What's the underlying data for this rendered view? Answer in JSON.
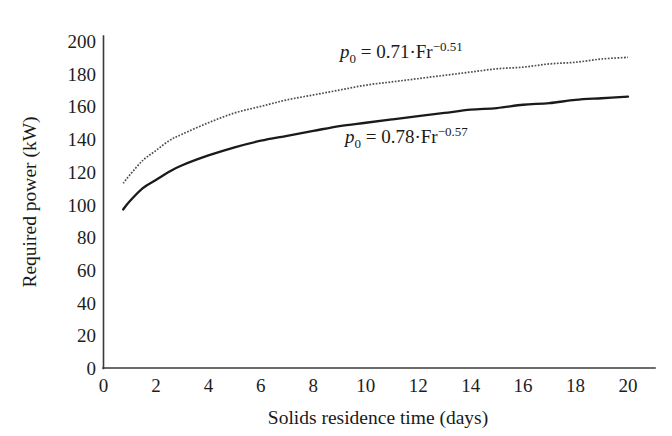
{
  "chart_data": {
    "type": "line",
    "title": "",
    "xlabel": "Solids residence time (days)",
    "ylabel": "Required power (kW)",
    "xlim": [
      0,
      20
    ],
    "ylim": [
      0,
      200
    ],
    "xticks": [
      0,
      2,
      4,
      6,
      8,
      10,
      12,
      14,
      16,
      18,
      20
    ],
    "yticks": [
      0,
      20,
      40,
      60,
      80,
      100,
      120,
      140,
      160,
      180,
      200
    ],
    "grid": false,
    "legend_position": "inline-annotation",
    "x_domain_start": 0.75,
    "x_domain_end": 20,
    "series": [
      {
        "name": "p0 = 0.71*Fr^-0.51",
        "style": "dotted",
        "color": "#4e4e4e",
        "annotation": "p_0 = 0.71·Fr^−0.51",
        "x": [
          0.75,
          1,
          1.5,
          2,
          2.5,
          3,
          4,
          5,
          6,
          7,
          8,
          9,
          10,
          11,
          12,
          13,
          14,
          15,
          16,
          17,
          18,
          19,
          20
        ],
        "values": [
          113,
          118,
          127,
          133,
          139,
          143,
          150,
          156,
          160,
          164,
          167,
          170,
          173,
          175,
          177,
          179,
          181,
          183,
          184,
          186,
          187,
          189,
          190
        ]
      },
      {
        "name": "p0 = 0.78*Fr^-0.57",
        "style": "solid",
        "color": "#1a1a1a",
        "annotation": "p_0 = 0.78·Fr^−0.57",
        "x": [
          0.75,
          1,
          1.5,
          2,
          2.5,
          3,
          4,
          5,
          6,
          7,
          8,
          9,
          10,
          11,
          12,
          13,
          14,
          15,
          16,
          17,
          18,
          19,
          20
        ],
        "values": [
          97,
          102,
          110,
          115,
          120,
          124,
          130,
          135,
          139,
          142,
          145,
          148,
          150,
          152,
          154,
          156,
          158,
          159,
          161,
          162,
          164,
          165,
          166
        ]
      }
    ]
  },
  "annotations": {
    "upper": {
      "var": "p",
      "sub": "0",
      "body": " = 0.71·Fr",
      "sup": "−0.51",
      "x": 340,
      "y": 58
    },
    "lower": {
      "var": "p",
      "sub": "0",
      "body": " = 0.78·Fr",
      "sup": "−0.57",
      "x": 345,
      "y": 143
    }
  },
  "axes": {
    "x_title": "Solids residence time (days)",
    "y_title": "Required power (kW)",
    "x_tick_labels": [
      "0",
      "2",
      "4",
      "6",
      "8",
      "10",
      "12",
      "14",
      "16",
      "18",
      "20"
    ],
    "y_tick_labels": [
      "0",
      "20",
      "40",
      "60",
      "80",
      "100",
      "120",
      "140",
      "160",
      "180",
      "200"
    ]
  },
  "colors": {
    "background": "#ffffff",
    "axis": "#3a3a3a",
    "solid_curve": "#1a1a1a",
    "dotted_curve": "#4e4e4e",
    "text": "#1a1a1a"
  }
}
